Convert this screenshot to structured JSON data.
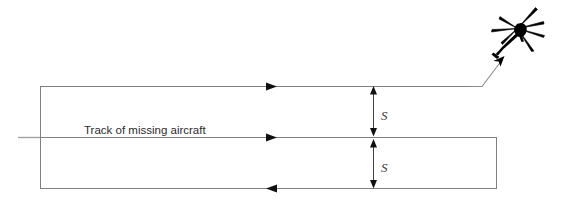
{
  "diagram": {
    "type": "search-pattern-diagram",
    "title_text": "",
    "colors": {
      "leg_line": "#808080",
      "track_line": "#999999",
      "dimension_line": "#4a4a4a",
      "aircraft_silhouette": "#000000",
      "label_text": "#2b2b2b",
      "separation_text": "#3a3a3a",
      "background": "#ffffff"
    },
    "labels": {
      "track_label": "Track of missing aircraft",
      "separation_upper": "S",
      "separation_lower": "S"
    },
    "legs": [
      {
        "name": "upper-search-leg",
        "direction": "right",
        "y": 86,
        "x_start": 40,
        "x_end": 470,
        "arrow_x": 272,
        "arrow_direction": "right"
      },
      {
        "name": "center-search-leg",
        "direction": "right",
        "y": 137,
        "x_start": 40,
        "x_end": 497,
        "arrow_x": 272,
        "arrow_direction": "right"
      },
      {
        "name": "lower-search-leg",
        "direction": "left",
        "y": 188,
        "x_start": 40,
        "x_end": 497,
        "arrow_x": 272,
        "arrow_direction": "left"
      }
    ],
    "track_line": {
      "name": "missing-aircraft-track",
      "y": 137,
      "x_start": 18,
      "x_end": 497
    },
    "turn_segments": [
      {
        "name": "left-turn-connector",
        "x": 40,
        "y_top": 86,
        "y_bottom": 188
      },
      {
        "name": "right-turn-connector",
        "x": 497,
        "y_top": 137,
        "y_bottom": 188
      }
    ],
    "egress_path": {
      "name": "helicopter-egress-path",
      "points": "470,86 482,86 505,56"
    },
    "dimensions": [
      {
        "name": "separation-upper",
        "x": 373,
        "y_top": 86,
        "y_bottom": 136,
        "label": "S",
        "label_x": 381,
        "label_y": 116
      },
      {
        "name": "separation-lower",
        "x": 373,
        "y_top": 139,
        "y_bottom": 188,
        "label": "S",
        "label_x": 381,
        "label_y": 169
      }
    ],
    "aircraft": {
      "name": "helicopter-icon",
      "description": "search helicopter silhouette",
      "x": 490,
      "y": 8,
      "width": 56,
      "height": 52
    },
    "text_positions": {
      "track_label_x": 84,
      "track_label_y": 133
    }
  }
}
